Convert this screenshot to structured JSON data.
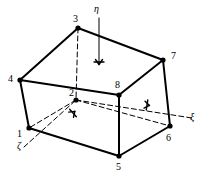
{
  "figure": {
    "type": "hexahedral-element-diagram",
    "stroke_color": "#000000",
    "background_color": "#ffffff",
    "solid_line_width": 2,
    "dashed_line_width": 1,
    "axis_line_width": 1
  },
  "nodes": [
    {
      "id": "1",
      "label": "1",
      "x": 29,
      "y": 128,
      "label_x": 17,
      "label_y": 129,
      "visible": true
    },
    {
      "id": "2",
      "label": "2",
      "x": 76,
      "y": 100,
      "label_x": 69,
      "label_y": 88,
      "visible": true
    },
    {
      "id": "3",
      "label": "3",
      "x": 78,
      "y": 28,
      "label_x": 73,
      "label_y": 14,
      "visible": true
    },
    {
      "id": "4",
      "label": "4",
      "x": 20,
      "y": 80,
      "label_x": 8,
      "label_y": 74,
      "visible": true
    },
    {
      "id": "5",
      "label": "5",
      "x": 119,
      "y": 156,
      "label_x": 116,
      "label_y": 162,
      "visible": true
    },
    {
      "id": "6",
      "label": "6",
      "x": 170,
      "y": 126,
      "label_x": 166,
      "label_y": 133,
      "visible": true
    },
    {
      "id": "7",
      "label": "7",
      "x": 163,
      "y": 60,
      "label_x": 171,
      "label_y": 51,
      "visible": true
    },
    {
      "id": "8",
      "label": "8",
      "x": 119,
      "y": 95,
      "label_x": 115,
      "label_y": 80,
      "visible": true
    }
  ],
  "solid_edges": [
    {
      "from": "4",
      "to": "3"
    },
    {
      "from": "3",
      "to": "7"
    },
    {
      "from": "4",
      "to": "8"
    },
    {
      "from": "8",
      "to": "7"
    },
    {
      "from": "4",
      "to": "1"
    },
    {
      "from": "7",
      "to": "6"
    },
    {
      "from": "8",
      "to": "5"
    },
    {
      "from": "1",
      "to": "5"
    },
    {
      "from": "5",
      "to": "6"
    }
  ],
  "dashed_edges": [
    {
      "from": "3",
      "to": "2"
    },
    {
      "from": "2",
      "to": "1"
    },
    {
      "from": "2",
      "to": "6"
    }
  ],
  "axes": [
    {
      "name": "eta",
      "label": "η",
      "label_x": 94,
      "label_y": 4,
      "from_x": 99,
      "from_y": 18,
      "to_x": 99,
      "to_y": 62,
      "arrow_style": "cross-tick",
      "dashed": false
    },
    {
      "name": "xi",
      "label": "ξ",
      "label_x": 190,
      "label_y": 112,
      "from_x": 76,
      "from_y": 100,
      "to_x": 192,
      "to_y": 118,
      "arrow_x": 147,
      "arrow_y": 105,
      "arrow_style": "cross-tick",
      "dashed": true
    },
    {
      "name": "zeta",
      "label": "ζ",
      "label_x": 17,
      "label_y": 141,
      "from_x": 24,
      "from_y": 147,
      "to_x": 76,
      "to_y": 100,
      "arrow_x": 73,
      "arrow_y": 113,
      "arrow_style": "cross-tick",
      "dashed": true
    }
  ]
}
